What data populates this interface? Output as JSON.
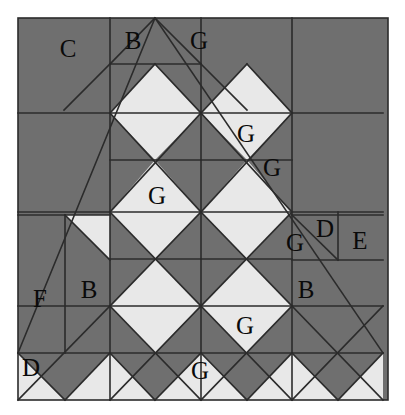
{
  "figure": {
    "canvas": {
      "width": 405,
      "height": 415
    },
    "pattern_area": {
      "x": 18,
      "y": 18,
      "width": 370,
      "height": 382
    },
    "grid": {
      "columns": 4,
      "rows": 4,
      "cell_size": 91,
      "x_lines": [
        18,
        110,
        201,
        292,
        383
      ],
      "y_lines": [
        18,
        113,
        212,
        306,
        400
      ]
    }
  },
  "colors": {
    "dark_fabric": "#6f6f6f",
    "light_fabric": "#e8e8e8",
    "seam_line": "#2b2b2b",
    "background": "#ffffff",
    "label_text": "#0a0a0a"
  },
  "legend": {
    "pieces": [
      {
        "key": "B",
        "name": "B"
      },
      {
        "key": "C",
        "name": "C"
      },
      {
        "key": "D",
        "name": "D"
      },
      {
        "key": "E",
        "name": "E"
      },
      {
        "key": "F",
        "name": "F"
      },
      {
        "key": "G",
        "name": "G"
      }
    ]
  },
  "labels": [
    {
      "id": "label-c-1",
      "text": "C",
      "x": 68,
      "y": 48
    },
    {
      "id": "label-b-1",
      "text": "B",
      "x": 133,
      "y": 40
    },
    {
      "id": "label-g-1",
      "text": "G",
      "x": 199,
      "y": 40
    },
    {
      "id": "label-g-2",
      "text": "G",
      "x": 246,
      "y": 133
    },
    {
      "id": "label-g-3",
      "text": "G",
      "x": 272,
      "y": 167
    },
    {
      "id": "label-g-4",
      "text": "G",
      "x": 157,
      "y": 195
    },
    {
      "id": "label-d-1",
      "text": "D",
      "x": 325,
      "y": 228
    },
    {
      "id": "label-e-1",
      "text": "E",
      "x": 360,
      "y": 240
    },
    {
      "id": "label-g-5",
      "text": "G",
      "x": 295,
      "y": 242
    },
    {
      "id": "label-f-1",
      "text": "F",
      "x": 40,
      "y": 298
    },
    {
      "id": "label-b-2",
      "text": "B",
      "x": 89,
      "y": 289
    },
    {
      "id": "label-b-3",
      "text": "B",
      "x": 306,
      "y": 289
    },
    {
      "id": "label-g-6",
      "text": "G",
      "x": 245,
      "y": 325
    },
    {
      "id": "label-d-2",
      "text": "D",
      "x": 31,
      "y": 367
    },
    {
      "id": "label-g-7",
      "text": "G",
      "x": 200,
      "y": 370
    }
  ],
  "shapes": {
    "dark_polygons": [
      "18,18 110,18 110,113 18,113",
      "18,113 110,113 110,212 18,212",
      "110,18 201,18 201,18 155,64 110,18",
      "110,18 155,64 110,113 110,18",
      "201,18 247,64 201,64 155,64",
      "155,64 201,64 247,64 201,113 155,113",
      "110,113 155,64 201,113 155,160",
      "201,113 247,64 292,113 247,160",
      "292,18 383,18 383,113 292,113",
      "292,113 383,113 383,212 292,212",
      "110,113 155,160 110,212",
      "155,160 201,113 201,160 155,160",
      "155,160 201,160 247,160 201,212 155,212",
      "247,160 292,113 292,212 247,212",
      "110,212 155,160 201,212 155,259",
      "201,212 247,160 292,212 247,259",
      "18,212 110,212 110,259 65,215 18,259",
      "65,215 110,259 18,259 18,215",
      "18,212 110,212 65,215",
      "18,259 110,259 110,306 18,306",
      "110,259 155,259 110,306",
      "155,259 201,212 201,306 155,306 110,306",
      "201,306 247,259 292,306 247,353",
      "201,212 247,259 201,306",
      "292,212 383,212 383,306 292,306",
      "292,212 347,212 383,248 383,212",
      "110,306 155,259 201,306 155,353",
      "292,306 338,353 292,400 292,306",
      "18,306 110,306 110,353 65,400 18,400",
      "110,353 155,353 110,400",
      "155,353 201,306 247,353 201,400",
      "247,353 292,306 338,353 292,400",
      "338,353 383,306 383,400"
    ],
    "light_polygons": [
      "110,113 155,64 201,113 155,160",
      "201,113 247,64 292,113 247,160"
    ]
  }
}
